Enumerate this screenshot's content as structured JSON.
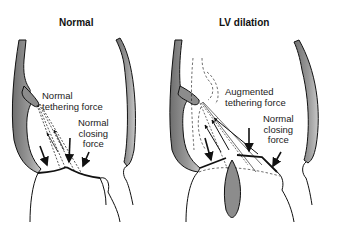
{
  "panels": [
    {
      "title": "Normal",
      "labels": {
        "tethering": [
          "Normal",
          "tethering force"
        ],
        "closing": [
          "Normal",
          "closing",
          "force"
        ]
      }
    },
    {
      "title": "LV dilation",
      "labels": {
        "tethering": [
          "Augmented",
          "tethering force"
        ],
        "closing": [
          "Normal",
          "closing",
          "force"
        ]
      }
    }
  ],
  "colors": {
    "wall_fill": "#8c8c8c",
    "stroke": "#111111",
    "background": "#ffffff"
  }
}
